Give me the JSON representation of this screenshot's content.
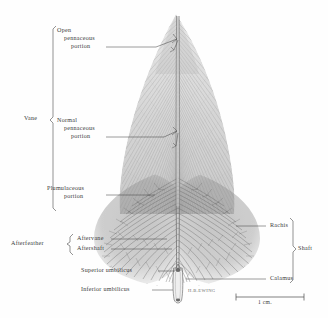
{
  "plate": {
    "title": "Feather anatomy plate",
    "background_color": "#fefefe",
    "ink_color": "#3a3a3a",
    "subject": "bird contour feather"
  },
  "brackets": {
    "vane": {
      "label": "Vane"
    },
    "afterfeather": {
      "label": "Afterfeather"
    },
    "shaft": {
      "label": "Shaft"
    }
  },
  "labels": {
    "open_pennaceous": {
      "line1": "Open",
      "line2": "pennaceous",
      "line3": "portion"
    },
    "normal_pennaceous": {
      "line1": "Normal",
      "line2": "pennaceous",
      "line3": "portion"
    },
    "plumulaceous": {
      "line1": "Plumulaceous",
      "line2": "portion"
    },
    "aftervane": {
      "text": "Aftervane"
    },
    "aftershaft": {
      "text": "Aftershaft"
    },
    "superior_umbilicus": {
      "text": "Superior umbilicus"
    },
    "inferior_umbilicus": {
      "text": "Inferior umbilicus"
    },
    "rachis": {
      "text": "Rachis"
    },
    "calamus": {
      "text": "Calamus"
    }
  },
  "scale_bar": {
    "value": "1 cm."
  },
  "signature": {
    "text": "H.B.EWING"
  }
}
